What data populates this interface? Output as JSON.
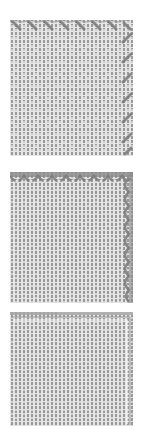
{
  "figure": {
    "type": "stitch-chart-swatches",
    "colors": {
      "background": "#ffffff",
      "grid_gutter": "#e4e4e4",
      "stitch_fill": "#9a9a9a",
      "edging": "#7a7a7a"
    },
    "swatches": [
      {
        "id": "swatch-1",
        "edging": "diagonal-cross-stitch",
        "edging_sides": [
          "top",
          "right"
        ],
        "top": 20,
        "height": 136
      },
      {
        "id": "swatch-2",
        "edging": "scalloped-arc",
        "edging_sides": [
          "top",
          "right"
        ],
        "top": 172,
        "height": 131
      },
      {
        "id": "swatch-3",
        "edging": "thin-outline",
        "edging_sides": [
          "top",
          "right"
        ],
        "top": 312,
        "height": 114
      }
    ]
  }
}
